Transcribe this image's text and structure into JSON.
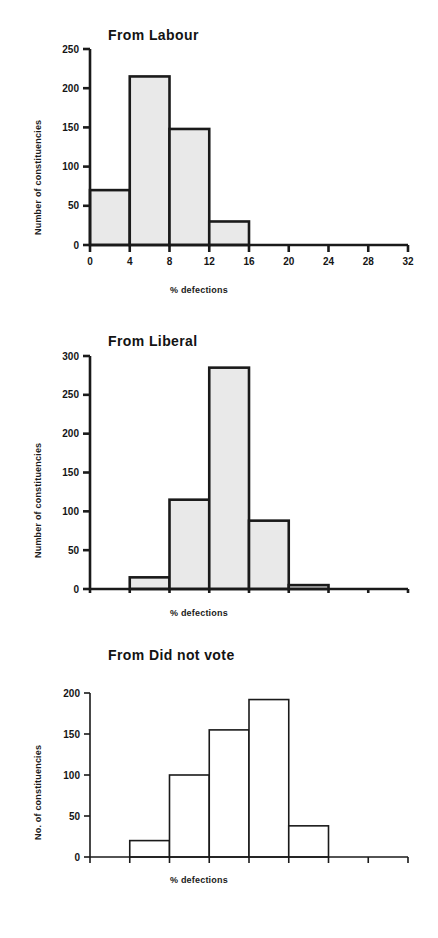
{
  "figure": {
    "background": "#ffffff",
    "axis_color": "#1a1a1a",
    "bar_outline": "#1a1a1a",
    "bar_fill_shaded": "#e9e9e9",
    "bar_fill_open": "#ffffff"
  },
  "chart_data": [
    {
      "type": "bar",
      "title": "From Labour",
      "xlabel": "% defections",
      "ylabel": "Number of constituencies",
      "categories": [
        "0-4",
        "4-8",
        "8-12",
        "12-16",
        "16-20",
        "20-24",
        "24-28",
        "28-32"
      ],
      "bin_edges": [
        0,
        4,
        8,
        12,
        16,
        20,
        24,
        28,
        32
      ],
      "values": [
        70,
        215,
        148,
        30,
        0,
        0,
        0,
        0
      ],
      "xticks": [
        0,
        4,
        8,
        12,
        16,
        20,
        24,
        28,
        32
      ],
      "xtick_labels": [
        "0",
        "4",
        "8",
        "12",
        "16",
        "20",
        "24",
        "28",
        "32"
      ],
      "yticks": [
        0,
        50,
        100,
        150,
        200,
        250
      ],
      "ytick_labels": [
        "0",
        "50",
        "100",
        "150",
        "200",
        "250"
      ],
      "xlim": [
        0,
        32
      ],
      "ylim": [
        0,
        250
      ],
      "grid": false,
      "legend": "none",
      "bar_style": "shaded"
    },
    {
      "type": "bar",
      "title": "From Liberal",
      "xlabel": "% defections",
      "ylabel": "Number of constituencies",
      "categories": [
        "0-4",
        "4-8",
        "8-12",
        "12-16",
        "16-20",
        "20-24",
        "24-28",
        "28-32"
      ],
      "bin_edges": [
        0,
        4,
        8,
        12,
        16,
        20,
        24,
        28,
        32
      ],
      "values": [
        0,
        15,
        115,
        285,
        88,
        5,
        0,
        0
      ],
      "xticks": [
        0,
        4,
        8,
        12,
        16,
        20,
        24,
        28,
        32
      ],
      "xtick_labels": [
        "0",
        "4",
        "8",
        "12",
        "16",
        "20",
        "24",
        "28",
        "32"
      ],
      "yticks": [
        0,
        50,
        100,
        150,
        200,
        250,
        300
      ],
      "ytick_labels": [
        "0",
        "50",
        "100",
        "150",
        "200",
        "250",
        "300"
      ],
      "xlim": [
        0,
        32
      ],
      "ylim": [
        0,
        300
      ],
      "grid": false,
      "legend": "none",
      "bar_style": "shaded"
    },
    {
      "type": "bar",
      "title": "From Did not vote",
      "xlabel": "% defections",
      "ylabel": "No. of constituencies",
      "categories": [
        "0-4",
        "4-8",
        "8-12",
        "12-16",
        "16-20",
        "20-24",
        "24-28",
        "28-32"
      ],
      "bin_edges": [
        0,
        4,
        8,
        12,
        16,
        20,
        24,
        28,
        32
      ],
      "values": [
        0,
        20,
        100,
        155,
        192,
        38,
        0,
        0
      ],
      "xticks": [
        0,
        4,
        8,
        12,
        16,
        20,
        24,
        28,
        32
      ],
      "xtick_labels": [
        "0",
        "4",
        "8",
        "12",
        "16",
        "20",
        "24",
        "28",
        "32"
      ],
      "yticks": [
        0,
        50,
        100,
        150,
        200
      ],
      "ytick_labels": [
        "0",
        "50",
        "100",
        "150",
        "200"
      ],
      "xlim": [
        0,
        32
      ],
      "ylim": [
        0,
        200
      ],
      "grid": false,
      "legend": "none",
      "bar_style": "open"
    }
  ]
}
